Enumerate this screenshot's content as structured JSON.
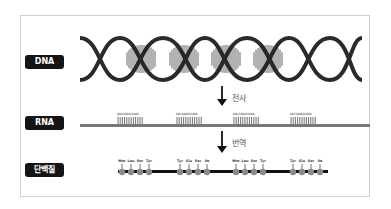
{
  "labels": {
    "dna": "DNA",
    "rna": "RNA",
    "protein": "단백질"
  },
  "steps": {
    "transcription": "전사",
    "translation": "번역"
  },
  "rna_segments": [
    {
      "seq": "AUGCUUUCGUAU",
      "x": 117
    },
    {
      "seq": "UACGAAAGCAUA",
      "x": 176
    },
    {
      "seq": "AUGCUUUCGUAU",
      "x": 233
    },
    {
      "seq": "UACGAAAGCAUA",
      "x": 290
    }
  ],
  "amino_acids": [
    {
      "name": "Met",
      "x": 122
    },
    {
      "name": "Leu",
      "x": 131
    },
    {
      "name": "Ser",
      "x": 140
    },
    {
      "name": "Tyr",
      "x": 149
    },
    {
      "name": "Tyr",
      "x": 180
    },
    {
      "name": "Glu",
      "x": 189
    },
    {
      "name": "Ser",
      "x": 198
    },
    {
      "name": "Ile",
      "x": 207
    },
    {
      "name": "Met",
      "x": 236
    },
    {
      "name": "Leu",
      "x": 245
    },
    {
      "name": "Ser",
      "x": 254
    },
    {
      "name": "Tyr",
      "x": 263
    },
    {
      "name": "Tyr",
      "x": 293
    },
    {
      "name": "Glu",
      "x": 302
    },
    {
      "name": "Ser",
      "x": 311
    },
    {
      "name": "Ile",
      "x": 320
    }
  ],
  "colors": {
    "strand": "#2a2a2a",
    "rna": "#777777",
    "bead": "#8a8a8a",
    "label_bg": "#141414"
  }
}
